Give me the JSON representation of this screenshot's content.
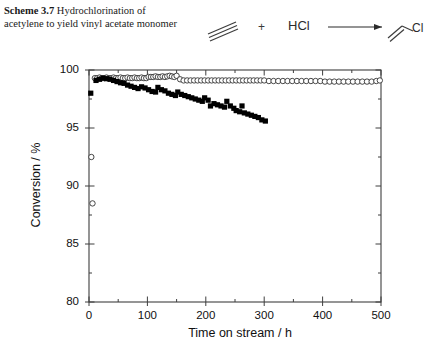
{
  "caption": {
    "label": "Scheme 3.7",
    "text": "Hydrochlorination of acetylene to yield vinyl acetate monomer"
  },
  "scheme": {
    "reactant_name": "acetylene-triple-bond",
    "plus": "+",
    "coreactant": "HCl",
    "arrow": "reaction-arrow",
    "product_name": "vinyl-chloride",
    "product_label": "Cl"
  },
  "chart_data": {
    "type": "scatter",
    "title": "",
    "xlabel": "Time on stream / h",
    "ylabel": "Conversion / %",
    "xlim": [
      0,
      500
    ],
    "ylim": [
      80,
      100
    ],
    "xticks": [
      0,
      100,
      200,
      300,
      400,
      500
    ],
    "yticks": [
      80,
      85,
      90,
      95,
      100
    ],
    "xtick_labels": [
      "0",
      "100",
      "200",
      "300",
      "400",
      "500"
    ],
    "ytick_labels": [
      "80",
      "85",
      "90",
      "95",
      "100"
    ],
    "x_minor_interval": 50,
    "y_minor_interval": 2.5,
    "grid": false,
    "legend": "none",
    "frame": "box",
    "series": [
      {
        "name": "open-circles",
        "marker": "open-circle",
        "color": "#333333",
        "points": [
          [
            4,
            92.5
          ],
          [
            6,
            88.5
          ],
          [
            10,
            99.3
          ],
          [
            14,
            99.3
          ],
          [
            18,
            99.35
          ],
          [
            22,
            99.3
          ],
          [
            26,
            99.3
          ],
          [
            30,
            99.35
          ],
          [
            34,
            99.3
          ],
          [
            38,
            99.3
          ],
          [
            42,
            99.35
          ],
          [
            46,
            99.3
          ],
          [
            50,
            99.3
          ],
          [
            54,
            99.35
          ],
          [
            58,
            99.3
          ],
          [
            62,
            99.3
          ],
          [
            66,
            99.35
          ],
          [
            70,
            99.3
          ],
          [
            74,
            99.3
          ],
          [
            78,
            99.35
          ],
          [
            82,
            99.3
          ],
          [
            86,
            99.3
          ],
          [
            90,
            99.35
          ],
          [
            94,
            99.3
          ],
          [
            98,
            99.3
          ],
          [
            102,
            99.4
          ],
          [
            106,
            99.4
          ],
          [
            110,
            99.4
          ],
          [
            114,
            99.45
          ],
          [
            118,
            99.4
          ],
          [
            122,
            99.4
          ],
          [
            126,
            99.45
          ],
          [
            130,
            99.4
          ],
          [
            134,
            99.45
          ],
          [
            138,
            99.5
          ],
          [
            142,
            99.45
          ],
          [
            146,
            99.4
          ],
          [
            150,
            99.5
          ],
          [
            156,
            99.2
          ],
          [
            162,
            99.1
          ],
          [
            168,
            99.1
          ],
          [
            174,
            99.1
          ],
          [
            180,
            99.1
          ],
          [
            186,
            99.1
          ],
          [
            192,
            99.1
          ],
          [
            198,
            99.1
          ],
          [
            204,
            99.1
          ],
          [
            210,
            99.1
          ],
          [
            216,
            99.1
          ],
          [
            222,
            99.1
          ],
          [
            228,
            99.1
          ],
          [
            234,
            99.1
          ],
          [
            240,
            99.1
          ],
          [
            246,
            99.1
          ],
          [
            252,
            99.1
          ],
          [
            258,
            99.1
          ],
          [
            264,
            99.1
          ],
          [
            270,
            99.1
          ],
          [
            276,
            99.1
          ],
          [
            282,
            99.1
          ],
          [
            288,
            99.1
          ],
          [
            294,
            99.1
          ],
          [
            300,
            99.1
          ],
          [
            308,
            99.05
          ],
          [
            316,
            99.05
          ],
          [
            324,
            99.05
          ],
          [
            332,
            99.05
          ],
          [
            340,
            99.05
          ],
          [
            348,
            99.05
          ],
          [
            356,
            99.05
          ],
          [
            364,
            99.05
          ],
          [
            372,
            99.05
          ],
          [
            380,
            99.05
          ],
          [
            388,
            99.05
          ],
          [
            396,
            99.05
          ],
          [
            404,
            99.0
          ],
          [
            412,
            99.0
          ],
          [
            420,
            99.0
          ],
          [
            428,
            99.0
          ],
          [
            436,
            99.0
          ],
          [
            444,
            99.0
          ],
          [
            452,
            99.0
          ],
          [
            460,
            99.0
          ],
          [
            468,
            99.0
          ],
          [
            476,
            99.0
          ],
          [
            484,
            99.0
          ],
          [
            492,
            99.05
          ],
          [
            498,
            99.1
          ]
        ]
      },
      {
        "name": "filled-squares",
        "marker": "filled-square",
        "color": "#000000",
        "points": [
          [
            3,
            98.0
          ],
          [
            12,
            99.1
          ],
          [
            18,
            99.2
          ],
          [
            24,
            99.3
          ],
          [
            30,
            99.25
          ],
          [
            36,
            99.2
          ],
          [
            42,
            99.1
          ],
          [
            48,
            99.0
          ],
          [
            54,
            98.9
          ],
          [
            60,
            98.85
          ],
          [
            66,
            98.7
          ],
          [
            72,
            98.6
          ],
          [
            78,
            98.5
          ],
          [
            84,
            98.4
          ],
          [
            90,
            98.55
          ],
          [
            96,
            98.45
          ],
          [
            102,
            98.3
          ],
          [
            108,
            98.15
          ],
          [
            114,
            98.1
          ],
          [
            118,
            98.5
          ],
          [
            124,
            98.3
          ],
          [
            130,
            98.2
          ],
          [
            136,
            98.0
          ],
          [
            142,
            97.9
          ],
          [
            148,
            97.8
          ],
          [
            152,
            98.1
          ],
          [
            158,
            97.9
          ],
          [
            164,
            97.8
          ],
          [
            170,
            97.7
          ],
          [
            176,
            97.6
          ],
          [
            182,
            97.5
          ],
          [
            188,
            97.4
          ],
          [
            194,
            97.3
          ],
          [
            198,
            97.6
          ],
          [
            204,
            97.4
          ],
          [
            208,
            96.9
          ],
          [
            214,
            97.1
          ],
          [
            220,
            97.0
          ],
          [
            226,
            96.9
          ],
          [
            232,
            96.8
          ],
          [
            236,
            97.3
          ],
          [
            242,
            96.9
          ],
          [
            248,
            96.7
          ],
          [
            252,
            96.5
          ],
          [
            258,
            96.4
          ],
          [
            262,
            96.9
          ],
          [
            266,
            96.3
          ],
          [
            272,
            96.2
          ],
          [
            278,
            96.1
          ],
          [
            284,
            96.0
          ],
          [
            290,
            95.9
          ],
          [
            296,
            95.7
          ],
          [
            302,
            95.6
          ]
        ]
      }
    ]
  }
}
